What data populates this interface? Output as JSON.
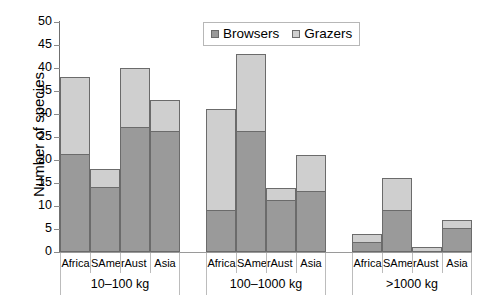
{
  "chart_data": {
    "type": "bar",
    "subtype": "stacked-grouped-bar",
    "title": "",
    "xlabel": "",
    "ylabel": "Number of species",
    "ylim": [
      0,
      50
    ],
    "yticks": [
      0,
      5,
      10,
      15,
      20,
      25,
      30,
      35,
      40,
      45,
      50
    ],
    "grid": false,
    "legend_position": "top-center",
    "legend": [
      "Browsers",
      "Grazers"
    ],
    "series": [
      {
        "name": "Browsers",
        "color": "#9a9a9a",
        "values": [
          21,
          14,
          27,
          26,
          9,
          26,
          11,
          13,
          2,
          9,
          0,
          5
        ]
      },
      {
        "name": "Grazers",
        "color": "#cfcfcf",
        "values": [
          17,
          4,
          13,
          7,
          22,
          17,
          3,
          8,
          2,
          7,
          1,
          2
        ]
      }
    ],
    "categories": [
      "Africa",
      "SAmer",
      "Aust",
      "Asia",
      "Africa",
      "SAmer",
      "Aust",
      "Asia",
      "Africa",
      "SAmer",
      "Aust",
      "Asia"
    ],
    "groups": [
      {
        "label": "10–100 kg",
        "bars": [
          {
            "category": "Africa",
            "browsers": 21,
            "grazers": 17,
            "total": 38
          },
          {
            "category": "SAmer",
            "browsers": 14,
            "grazers": 4,
            "total": 18
          },
          {
            "category": "Aust",
            "browsers": 27,
            "grazers": 13,
            "total": 40
          },
          {
            "category": "Asia",
            "browsers": 26,
            "grazers": 7,
            "total": 33
          }
        ]
      },
      {
        "label": "100–1000 kg",
        "bars": [
          {
            "category": "Africa",
            "browsers": 9,
            "grazers": 22,
            "total": 31
          },
          {
            "category": "SAmer",
            "browsers": 26,
            "grazers": 17,
            "total": 43
          },
          {
            "category": "Aust",
            "browsers": 11,
            "grazers": 3,
            "total": 14
          },
          {
            "category": "Asia",
            "browsers": 13,
            "grazers": 8,
            "total": 21
          }
        ]
      },
      {
        "label": ">1000 kg",
        "bars": [
          {
            "category": "Africa",
            "browsers": 2,
            "grazers": 2,
            "total": 4
          },
          {
            "category": "SAmer",
            "browsers": 9,
            "grazers": 7,
            "total": 16
          },
          {
            "category": "Aust",
            "browsers": 0,
            "grazers": 1,
            "total": 1
          },
          {
            "category": "Asia",
            "browsers": 5,
            "grazers": 2,
            "total": 7
          }
        ]
      }
    ]
  },
  "axis": {
    "y_title": "Number of species",
    "y_tick_labels": [
      "50",
      "45",
      "40",
      "35",
      "30",
      "25",
      "20",
      "15",
      "10",
      "5",
      "0"
    ]
  },
  "legend": {
    "browsers_label": "Browsers",
    "grazers_label": "Grazers",
    "browsers_color": "#9a9a9a",
    "grazers_color": "#cfcfcf"
  }
}
